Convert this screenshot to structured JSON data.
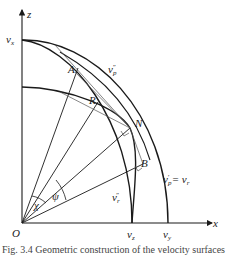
{
  "figure": {
    "axes": {
      "vertical_label": "z",
      "horizontal_label": "x",
      "origin_label": "O"
    },
    "axis_ticks": {
      "vx": {
        "base": "v",
        "sub": "x"
      },
      "vz": {
        "base": "v",
        "sub": "z"
      },
      "vy": {
        "base": "v",
        "sub": "y"
      }
    },
    "points": {
      "A": "A",
      "R": "R",
      "N": "N",
      "B": "B"
    },
    "curves": {
      "vp_double": {
        "base": "v",
        "sub": "p",
        "sup": "″"
      },
      "vr_double": {
        "base": "v",
        "sub": "r",
        "sup": "″"
      },
      "vp_prime_eq": {
        "base": "v",
        "sub": "p",
        "sup": "′",
        "rest": " = v",
        "rest_sub": "r"
      }
    },
    "angles": {
      "chi": "χ",
      "psi": "ψ"
    },
    "colors": {
      "stroke": "#1a1a1a",
      "construction": "#555555",
      "background": "#ffffff"
    },
    "caption": "Fig. 3.4  Geometric construction of the velocity surfaces"
  }
}
